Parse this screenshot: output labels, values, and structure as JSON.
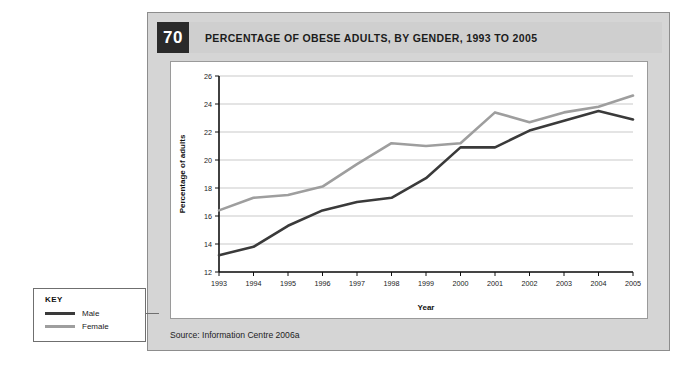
{
  "figure": {
    "number": "70",
    "title": "PERCENTAGE OF OBESE ADULTS, BY GENDER, 1993 TO 2005",
    "source": "Source: Information Centre 2006a"
  },
  "key": {
    "heading": "KEY",
    "items": [
      {
        "label": "Male",
        "color": "#3a3a3a"
      },
      {
        "label": "Female",
        "color": "#9e9e9e"
      }
    ]
  },
  "colors": {
    "male": "#3a3a3a",
    "female": "#9e9e9e",
    "panel_bg": "#d5d5d5",
    "header_bg": "#cfcfcf",
    "number_bg": "#2a2a2a",
    "grid": "#c9c9c9",
    "axis": "#111111"
  },
  "chart_data": {
    "type": "line",
    "title": "PERCENTAGE OF OBESE ADULTS, BY GENDER, 1993 TO 2005",
    "xlabel": "Year",
    "ylabel": "Percentage of adults",
    "x": [
      "1993",
      "1994",
      "1995",
      "1996",
      "1997",
      "1998",
      "1999",
      "2000",
      "2001",
      "2002",
      "2003",
      "2004",
      "2005"
    ],
    "xtick_labels": [
      "1993",
      "1994",
      "1995",
      "1996",
      "1997",
      "1998",
      "1999",
      "2000",
      "2001",
      "2002",
      "2003",
      "2004",
      "2005"
    ],
    "ytick_labels": [
      "12",
      "14",
      "16",
      "18",
      "20",
      "22",
      "24",
      "26"
    ],
    "yticks": [
      12,
      14,
      16,
      18,
      20,
      22,
      24,
      26
    ],
    "ylim": [
      12,
      26
    ],
    "grid": true,
    "grid_axis": "y",
    "legend_position": "external-key-box",
    "series": [
      {
        "name": "Male",
        "color": "#3a3a3a",
        "values": [
          13.2,
          13.8,
          15.3,
          16.4,
          17.0,
          17.3,
          18.7,
          20.9,
          20.9,
          22.1,
          22.8,
          23.5,
          22.9
        ]
      },
      {
        "name": "Female",
        "color": "#9e9e9e",
        "values": [
          16.4,
          17.3,
          17.5,
          18.1,
          19.7,
          21.2,
          21.0,
          21.2,
          23.4,
          22.7,
          23.4,
          23.8,
          24.6
        ]
      }
    ]
  }
}
